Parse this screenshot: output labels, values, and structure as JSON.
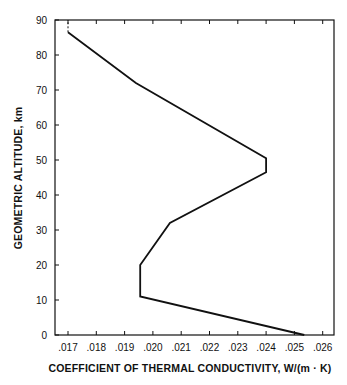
{
  "chart_data": {
    "type": "line",
    "title": "",
    "xlabel": "COEFFICIENT OF THERMAL CONDUCTIVITY, W/(m · K)",
    "ylabel": "GEOMETRIC ALTITUDE, km",
    "xlim": [
      0.01655,
      0.0262
    ],
    "ylim": [
      0,
      90
    ],
    "x_ticks": [
      ".017",
      ".018",
      ".019",
      ".020",
      ".021",
      ".022",
      ".023",
      ".024",
      ".025",
      ".026"
    ],
    "y_ticks": [
      "0",
      "10",
      "20",
      "30",
      "40",
      "50",
      "60",
      "70",
      "80",
      "90"
    ],
    "grid": false,
    "legend": null,
    "series": [
      {
        "name": "Thermal conductivity",
        "x": [
          0.02535,
          0.01955,
          0.01955,
          0.0206,
          0.024,
          0.024,
          0.0194,
          0.017
        ],
        "y": [
          0,
          11,
          20,
          32,
          46.5,
          50.5,
          72,
          86.5
        ],
        "style": "solid"
      },
      {
        "name": "Extension",
        "x": [
          0.017,
          0.017
        ],
        "y": [
          86.5,
          90
        ],
        "style": "dashed"
      }
    ]
  }
}
